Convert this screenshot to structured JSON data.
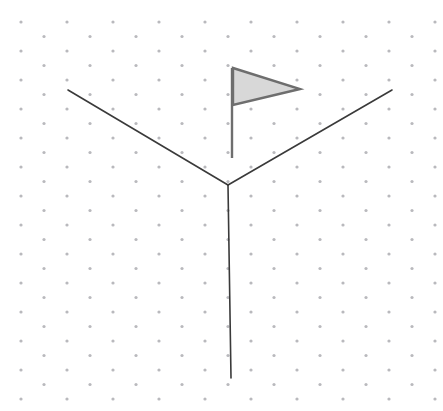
{
  "canvas": {
    "width": 443,
    "height": 411,
    "background_color": "#ffffff",
    "label": "drawing-canvas"
  },
  "grid": {
    "name": "dot-grid",
    "visible": true,
    "style": "staggered-dots",
    "dot_color": "#b9b9bd",
    "dot_radius": 1.6,
    "spacing_x": 46,
    "spacing_y": 29,
    "offset_x": 21,
    "offset_y": 22,
    "stagger_x": 23,
    "stagger_y": 14.5
  },
  "shapes": {
    "y_figure": {
      "name": "y-junction-figure",
      "stroke_color": "#3a3a3a",
      "stroke_width": 1.6,
      "vertex": {
        "x": 228,
        "y": 185
      },
      "arms": [
        {
          "name": "left-arm",
          "x1": 68,
          "y1": 90,
          "x2": 228,
          "y2": 185
        },
        {
          "name": "right-arm",
          "x1": 392,
          "y1": 90,
          "x2": 228,
          "y2": 185
        },
        {
          "name": "stem",
          "x1": 228,
          "y1": 185,
          "x2": 231,
          "y2": 378
        }
      ]
    },
    "flag": {
      "name": "pennant-flag",
      "fill_color": "#d8d8d8",
      "stroke_color": "#6e6e6e",
      "stroke_width": 2.4,
      "pole": {
        "x1": 232,
        "y1": 68,
        "x2": 232,
        "y2": 158,
        "width": 2.4,
        "color": "#6e6e6e"
      },
      "pennant_points": "233,68 300,89 233,105"
    }
  }
}
